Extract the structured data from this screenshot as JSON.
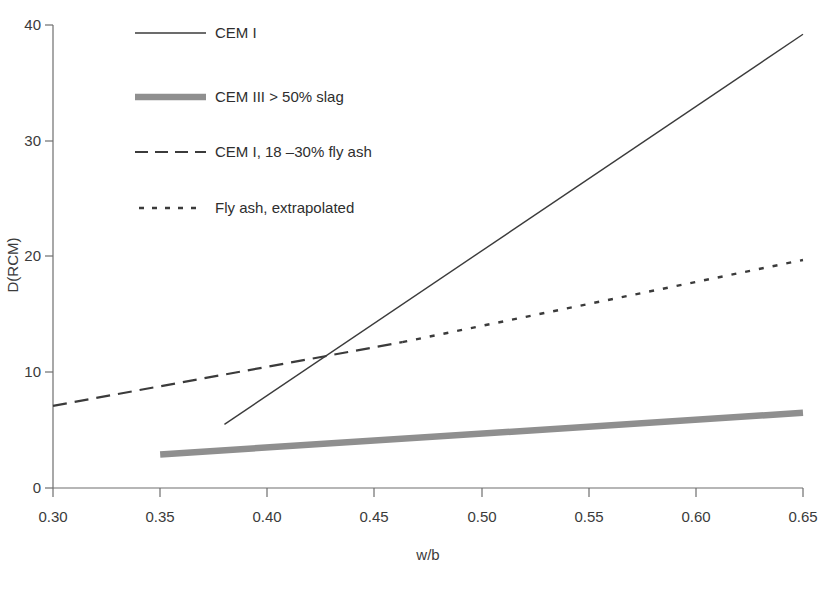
{
  "chart_data": {
    "type": "line",
    "title": "",
    "xlabel": "w/b",
    "ylabel": "D(RCM)",
    "xlim": [
      0.3,
      0.65
    ],
    "ylim": [
      0,
      40
    ],
    "grid": false,
    "legend_position": "top-left-inside",
    "x_ticks": [
      "0.30",
      "0.35",
      "0.40",
      "0.45",
      "0.50",
      "0.55",
      "0.60",
      "0.65"
    ],
    "x_tick_values": [
      0.3,
      0.35,
      0.4,
      0.45,
      0.5,
      0.55,
      0.6,
      0.65
    ],
    "y_ticks": [
      "0",
      "10",
      "20",
      "30",
      "40"
    ],
    "y_tick_values": [
      0,
      10,
      20,
      30,
      40
    ],
    "series": [
      {
        "name": "CEM I",
        "style": "solid",
        "color": "#3b3b3b",
        "width": 1.4,
        "x": [
          0.38,
          0.65
        ],
        "values": [
          5.5,
          39.2
        ]
      },
      {
        "name": "CEM III > 50% slag",
        "style": "solid-thick",
        "color": "#8f8f8f",
        "width": 6.5,
        "x": [
          0.35,
          0.65
        ],
        "values": [
          2.9,
          6.5
        ]
      },
      {
        "name": "CEM I, 18 –30% fly ash",
        "style": "dashed",
        "color": "#3b3b3b",
        "width": 2.2,
        "x": [
          0.3,
          0.463
        ],
        "values": [
          7.1,
          12.6
        ]
      },
      {
        "name": "Fly ash, extrapolated",
        "style": "dotted",
        "color": "#3b3b3b",
        "width": 2.4,
        "x": [
          0.463,
          0.65
        ],
        "values": [
          12.6,
          19.7
        ]
      }
    ]
  },
  "legend": {
    "entries": [
      {
        "label": "CEM I",
        "swatch": "solid-line-swatch"
      },
      {
        "label": "CEM III > 50% slag",
        "swatch": "thick-gray-line-swatch"
      },
      {
        "label": "CEM I, 18 –30% fly ash",
        "swatch": "dashed-line-swatch"
      },
      {
        "label": "Fly ash, extrapolated",
        "swatch": "dotted-line-swatch"
      }
    ]
  },
  "axes": {
    "x_title": "w/b",
    "y_title": "D(RCM)",
    "x_tick_labels": [
      "0.30",
      "0.35",
      "0.40",
      "0.45",
      "0.50",
      "0.55",
      "0.60",
      "0.65"
    ],
    "y_tick_labels": [
      "0",
      "10",
      "20",
      "30",
      "40"
    ]
  },
  "colors": {
    "axis": "#6e6e6e",
    "text": "#2e2e2e",
    "series_cem_i": "#3b3b3b",
    "series_slag": "#8f8f8f",
    "background": "#ffffff"
  }
}
